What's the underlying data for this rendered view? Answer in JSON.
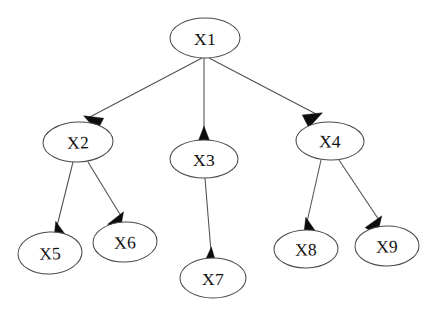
{
  "diagram": {
    "type": "directed-graph",
    "background_color": "#ffffff",
    "node_stroke_color": "#4a4a4a",
    "edge_stroke_color": "#4f4f4f",
    "arrow_fill_color": "#0d0d0d",
    "label_color": "#111111",
    "nodes": [
      {
        "id": "X1",
        "label": "X1",
        "cx": 205,
        "cy": 38,
        "rx": 35,
        "ry": 20,
        "rotate": 0
      },
      {
        "id": "X2",
        "label": "X2",
        "cx": 78,
        "cy": 142,
        "rx": 35,
        "ry": 20,
        "rotate": -2
      },
      {
        "id": "X3",
        "label": "X3",
        "cx": 204,
        "cy": 159,
        "rx": 34,
        "ry": 19,
        "rotate": 0
      },
      {
        "id": "X4",
        "label": "X4",
        "cx": 330,
        "cy": 141,
        "rx": 34,
        "ry": 19,
        "rotate": 1
      },
      {
        "id": "X5",
        "label": "X5",
        "cx": 50,
        "cy": 253,
        "rx": 32,
        "ry": 21,
        "rotate": -3
      },
      {
        "id": "X6",
        "label": "X6",
        "cx": 125,
        "cy": 242,
        "rx": 32,
        "ry": 20,
        "rotate": -2
      },
      {
        "id": "X7",
        "label": "X7",
        "cx": 213,
        "cy": 278,
        "rx": 33,
        "ry": 20,
        "rotate": 0
      },
      {
        "id": "X8",
        "label": "X8",
        "cx": 306,
        "cy": 249,
        "rx": 32,
        "ry": 19,
        "rotate": -1
      },
      {
        "id": "X9",
        "label": "X9",
        "cx": 387,
        "cy": 246,
        "rx": 32,
        "ry": 20,
        "rotate": -1
      }
    ],
    "edges": [
      {
        "id": "e1",
        "from": "X1",
        "to": "X2",
        "x1": 202,
        "y1": 58,
        "x2": 88,
        "y2": 118,
        "arrow_angle": 208
      },
      {
        "id": "e2",
        "from": "X1",
        "to": "X3",
        "x1": 204,
        "y1": 58,
        "x2": 204,
        "y2": 131,
        "arrow_angle": 270
      },
      {
        "id": "e3",
        "from": "X1",
        "to": "X4",
        "x1": 209,
        "y1": 58,
        "x2": 318,
        "y2": 115,
        "arrow_angle": 333
      },
      {
        "id": "e4",
        "from": "X2",
        "to": "X5",
        "x1": 73,
        "y1": 162,
        "x2": 57,
        "y2": 226,
        "arrow_angle": 255
      },
      {
        "id": "e5",
        "from": "X2",
        "to": "X6",
        "x1": 88,
        "y1": 162,
        "x2": 121,
        "y2": 216,
        "arrow_angle": 301
      },
      {
        "id": "e6",
        "from": "X3",
        "to": "X7",
        "x1": 205,
        "y1": 178,
        "x2": 211,
        "y2": 252,
        "arrow_angle": 274
      },
      {
        "id": "e7",
        "from": "X4",
        "to": "X8",
        "x1": 321,
        "y1": 160,
        "x2": 307,
        "y2": 222,
        "arrow_angle": 256
      },
      {
        "id": "e8",
        "from": "X4",
        "to": "X9",
        "x1": 339,
        "y1": 160,
        "x2": 379,
        "y2": 220,
        "arrow_angle": 304
      }
    ]
  }
}
